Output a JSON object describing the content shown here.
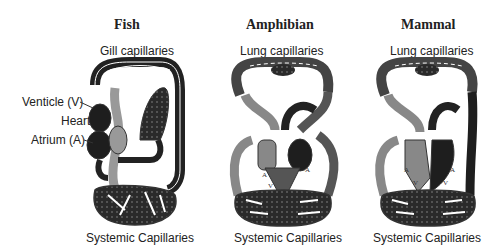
{
  "panels": [
    {
      "title": "Fish",
      "top_label": "Gill capillaries",
      "bottom_label": "Systemic Capillaries",
      "side_labels": [
        "Venticle (V)",
        "Heart",
        "Atrium (A)"
      ]
    },
    {
      "title": "Amphibian",
      "top_label": "Lung capillaries",
      "bottom_label": "Systemic Capillaries",
      "heart_marks": [
        "A",
        "V",
        "A"
      ]
    },
    {
      "title": "Mammal",
      "top_label": "Lung capillaries",
      "bottom_label": "Systemic Capillaries",
      "heart_marks": [
        "A",
        "V",
        "V",
        "A"
      ]
    }
  ],
  "colors": {
    "oxygenated": "#9a9a9a",
    "deoxygenated": "#1e1e1e",
    "outline": "#333333",
    "background": "#ffffff"
  }
}
